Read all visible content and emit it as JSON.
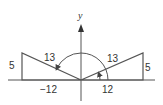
{
  "diagram": {
    "type": "reference-angle-triangles",
    "axes": {
      "y_label": "y",
      "origin": [
        81,
        80
      ],
      "x_axis_range_px": [
        8,
        155
      ],
      "y_axis_range_px": [
        25,
        101
      ]
    },
    "left_triangle": {
      "hypotenuse_label": "13",
      "vertical_leg_label": "5",
      "horizontal_leg_label": "−12",
      "vertices_px": [
        [
          22,
          80
        ],
        [
          22,
          53
        ],
        [
          81,
          80
        ]
      ]
    },
    "right_triangle": {
      "hypotenuse_label": "13",
      "vertical_leg_label": "5",
      "horizontal_leg_label": "12",
      "vertices_px": [
        [
          143,
          80
        ],
        [
          143,
          53
        ],
        [
          81,
          80
        ]
      ]
    },
    "large_arc": {
      "center_px": [
        81,
        80
      ],
      "radius_px": 27,
      "description": "angle arc from positive x-axis around to left hypotenuse"
    },
    "small_arc": {
      "center_px": [
        81,
        80
      ],
      "radius_px": 19,
      "description": "angle arc from positive x-axis to right hypotenuse"
    },
    "colors": {
      "stroke": "#555555",
      "text": "#333333",
      "background": "#ffffff"
    }
  }
}
